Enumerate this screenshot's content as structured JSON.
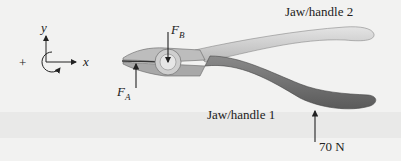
{
  "axes": {
    "y_label": "y",
    "x_label": "x",
    "sign_label": "+"
  },
  "forces": {
    "fa": {
      "symbol": "F",
      "subscript": "A"
    },
    "fb": {
      "symbol": "F",
      "subscript": "B"
    },
    "applied": {
      "label": "70 N"
    }
  },
  "labels": {
    "handle2": "Jaw/handle 2",
    "handle1": "Jaw/handle 1"
  },
  "colors": {
    "background": "#f2f2f1",
    "handle1": "#6e6e6e",
    "handle2": "#c8c8c8",
    "ink": "#222222"
  }
}
